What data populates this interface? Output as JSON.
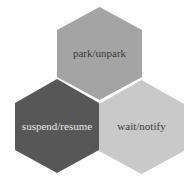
{
  "diagram": {
    "type": "hexagon-cluster",
    "background": "#ffffff",
    "hexagons": [
      {
        "id": "top",
        "label": "park/unpark",
        "fill": "#a4a4a4",
        "text_color": "#3a3a3a",
        "points": "99.5,7 142,30 142,77 99.5,100 57,77 57,30",
        "label_x": 99.5,
        "label_y": 57
      },
      {
        "id": "bottom-left",
        "label": "suspend/resume",
        "fill": "#575757",
        "text_color": "#e6e6e6",
        "points": "57,79 99,103 99,150 57,173 15,150 15,103",
        "label_x": 57,
        "label_y": 130
      },
      {
        "id": "bottom-right",
        "label": "wait/notify",
        "fill": "#c9c9c9",
        "text_color": "#3a3a3a",
        "points": "141.5,80 184,104 184,151 141.5,174 99,151 99,104",
        "label_x": 141.5,
        "label_y": 130
      }
    ]
  }
}
